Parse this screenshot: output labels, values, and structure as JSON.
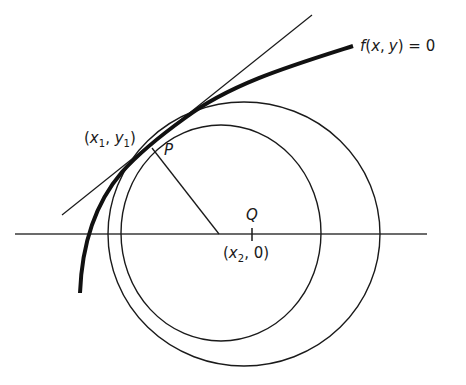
{
  "figure": {
    "colors": {
      "stroke": "#1a1a1a",
      "background": "#ffffff"
    },
    "labels": {
      "curve": {
        "f": "f",
        "open": "(",
        "x": "x",
        "comma": ",",
        "y": "y",
        "close": ")",
        "rest": " = 0"
      },
      "point_p": "P",
      "point_p_coords": {
        "open": "(",
        "x": "x",
        "sub1": "1",
        "comma": ", ",
        "y": "y",
        "sub2": "1",
        "close": ")"
      },
      "point_q": "Q",
      "point_q_coords": {
        "open": "(",
        "x": "x",
        "sub": "2",
        "rest": ", 0)"
      }
    },
    "geometry": {
      "x_axis": {
        "x1": 15,
        "x2": 427,
        "y": 234
      },
      "tangent_line": {
        "x1": 62,
        "y1": 215,
        "x2": 312,
        "y2": 15
      },
      "normal_line": {
        "x1": 152,
        "y1": 147,
        "x2": 219,
        "y2": 234
      },
      "inner_circle": {
        "cx": 221,
        "cy": 233,
        "r": 104
      },
      "outer_circle": {
        "cx": 244,
        "cy": 234,
        "r": 134
      },
      "q_tick": {
        "x": 252,
        "y1": 228,
        "y2": 240
      }
    }
  }
}
